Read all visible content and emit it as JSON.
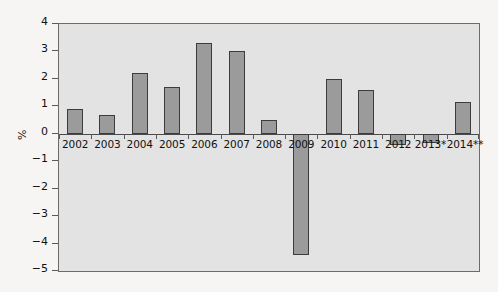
{
  "chart_data": {
    "type": "bar",
    "title": "",
    "subtitle": "",
    "xlabel": "",
    "ylabel": "%",
    "ylim": [
      -5,
      4
    ],
    "yticks": [
      4,
      3,
      2,
      1,
      0,
      -1,
      -2,
      -3,
      -4,
      -5
    ],
    "ytick_labels": [
      "4",
      "3",
      "2",
      "1",
      "0",
      "−1",
      "−2",
      "−3",
      "−4",
      "−5"
    ],
    "grid": false,
    "legend": null,
    "legend_position": "none",
    "categories": [
      "2002",
      "2003",
      "2004",
      "2005",
      "2006",
      "2007",
      "2008",
      "2009",
      "2010",
      "2011",
      "2012",
      "2013*",
      "2014**"
    ],
    "values": [
      0.9,
      0.7,
      2.2,
      1.7,
      3.3,
      3.0,
      0.5,
      -4.4,
      2.0,
      1.6,
      -0.4,
      -0.35,
      1.15
    ],
    "series": [
      {
        "name": "Annual change",
        "values": [
          0.9,
          0.7,
          2.2,
          1.7,
          3.3,
          3.0,
          0.5,
          -4.4,
          2.0,
          1.6,
          -0.4,
          -0.35,
          1.15
        ]
      }
    ],
    "annotations": [],
    "colors": {
      "bar_fill": "#9b9b9b",
      "bar_border": "#3c3c3c",
      "plot_background": "#e3e3e3",
      "figure_background": "#f6f5f3",
      "axis": "#5a5a5a",
      "text": "#111111"
    }
  }
}
